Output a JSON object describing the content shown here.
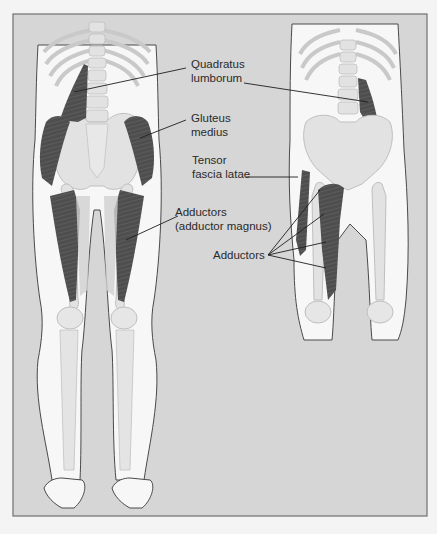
{
  "figure": {
    "panel_color": "#d6d6d6",
    "skin_color": "#f7f7f7",
    "bone_color": "#e2e2e2",
    "bone_stroke": "#c4c4c4",
    "muscle_color": "#4e4e4e",
    "outline_color": "#4a4a4a",
    "leader_color": "#1e1e1e",
    "views": {
      "left": "posterior-view",
      "right": "anterior-view"
    },
    "labels": {
      "quadratus_lumborum": [
        "Quadratus",
        "lumborum"
      ],
      "gluteus_medius": [
        "Gluteus",
        "medius"
      ],
      "tensor_fascia_latae": [
        "Tensor",
        "fascia latae"
      ],
      "adductors_magnus": [
        "Adductors",
        "(adductor magnus)"
      ],
      "adductors": [
        "Adductors"
      ]
    }
  }
}
